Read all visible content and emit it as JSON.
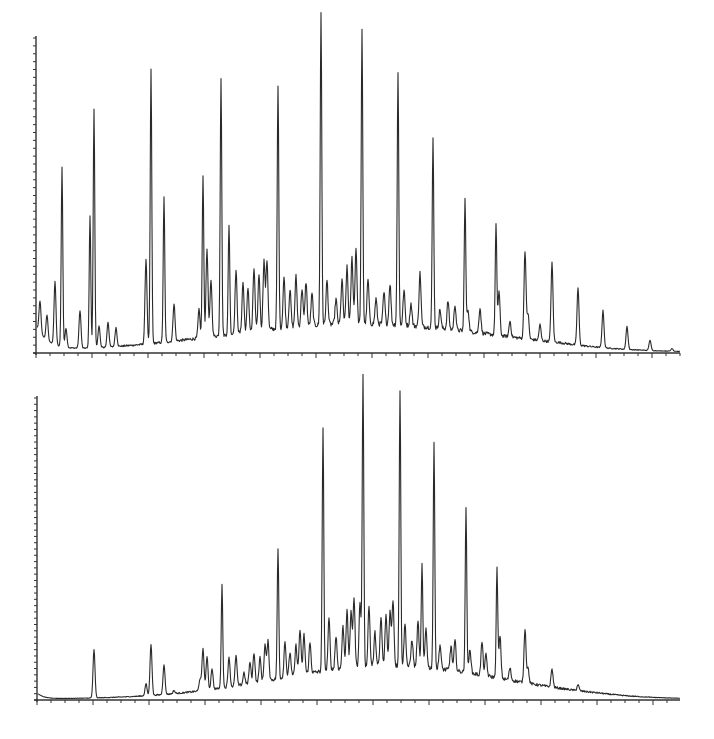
{
  "figure": {
    "caption_fragment": ""
  },
  "chart_data": [
    {
      "type": "line",
      "title": "",
      "subtitle": "Gas chromatogram (upper trace)",
      "xlabel": "",
      "ylabel": "",
      "grid": false,
      "legend": null,
      "x_range_px": [
        36,
        680
      ],
      "baseline_y_px": 353,
      "top_y_px": 38,
      "ylim": [
        0,
        100
      ],
      "y_minor_ticks": 40,
      "x_major_tick_step_px": 56,
      "x_minor_ticks_per_major": 4,
      "hump": {
        "center_x": 360,
        "height": 9,
        "width": 190
      },
      "start_decay": {
        "height": 8,
        "tau": 12
      },
      "tail_drop_from_x": 560,
      "peaks": [
        {
          "x": 40,
          "height": 10
        },
        {
          "x": 47,
          "height": 8
        },
        {
          "x": 55,
          "height": 20
        },
        {
          "x": 62,
          "height": 57
        },
        {
          "x": 66,
          "height": 6
        },
        {
          "x": 80,
          "height": 12
        },
        {
          "x": 90,
          "height": 42
        },
        {
          "x": 94,
          "height": 76
        },
        {
          "x": 99,
          "height": 7
        },
        {
          "x": 108,
          "height": 8
        },
        {
          "x": 116,
          "height": 6
        },
        {
          "x": 146,
          "height": 27
        },
        {
          "x": 151,
          "height": 87
        },
        {
          "x": 164,
          "height": 46
        },
        {
          "x": 174,
          "height": 12
        },
        {
          "x": 199,
          "height": 9
        },
        {
          "x": 203,
          "height": 51
        },
        {
          "x": 207,
          "height": 28
        },
        {
          "x": 211,
          "height": 18
        },
        {
          "x": 221,
          "height": 82
        },
        {
          "x": 229,
          "height": 35
        },
        {
          "x": 236,
          "height": 20
        },
        {
          "x": 243,
          "height": 16
        },
        {
          "x": 248,
          "height": 14
        },
        {
          "x": 254,
          "height": 20
        },
        {
          "x": 259,
          "height": 18
        },
        {
          "x": 264,
          "height": 22
        },
        {
          "x": 267,
          "height": 22
        },
        {
          "x": 278,
          "height": 77
        },
        {
          "x": 284,
          "height": 16
        },
        {
          "x": 290,
          "height": 12
        },
        {
          "x": 296,
          "height": 16
        },
        {
          "x": 302,
          "height": 12
        },
        {
          "x": 306,
          "height": 14
        },
        {
          "x": 312,
          "height": 10
        },
        {
          "x": 321,
          "height": 99
        },
        {
          "x": 327,
          "height": 14
        },
        {
          "x": 336,
          "height": 8
        },
        {
          "x": 342,
          "height": 14
        },
        {
          "x": 347,
          "height": 18
        },
        {
          "x": 352,
          "height": 21
        },
        {
          "x": 356,
          "height": 24
        },
        {
          "x": 362,
          "height": 93
        },
        {
          "x": 368,
          "height": 14
        },
        {
          "x": 376,
          "height": 8
        },
        {
          "x": 384,
          "height": 10
        },
        {
          "x": 390,
          "height": 13
        },
        {
          "x": 398,
          "height": 80
        },
        {
          "x": 404,
          "height": 11
        },
        {
          "x": 411,
          "height": 7
        },
        {
          "x": 420,
          "height": 17
        },
        {
          "x": 433,
          "height": 60
        },
        {
          "x": 440,
          "height": 6
        },
        {
          "x": 448,
          "height": 9
        },
        {
          "x": 455,
          "height": 8
        },
        {
          "x": 465,
          "height": 42
        },
        {
          "x": 468,
          "height": 7
        },
        {
          "x": 480,
          "height": 8
        },
        {
          "x": 496,
          "height": 35
        },
        {
          "x": 499,
          "height": 14
        },
        {
          "x": 510,
          "height": 5
        },
        {
          "x": 525,
          "height": 28
        },
        {
          "x": 528,
          "height": 8
        },
        {
          "x": 540,
          "height": 5
        },
        {
          "x": 552,
          "height": 25
        },
        {
          "x": 578,
          "height": 20
        },
        {
          "x": 603,
          "height": 15
        },
        {
          "x": 627,
          "height": 11
        },
        {
          "x": 650,
          "height": 6
        },
        {
          "x": 672,
          "height": 2
        }
      ]
    },
    {
      "type": "line",
      "title": "",
      "subtitle": "Gas chromatogram (lower trace)",
      "xlabel": "",
      "ylabel": "",
      "grid": false,
      "legend": null,
      "x_range_px": [
        37,
        680
      ],
      "baseline_y_px": 700,
      "top_y_px": 398,
      "ylim": [
        0,
        100
      ],
      "y_minor_ticks": 48,
      "x_major_tick_step_px": 56,
      "x_minor_ticks_per_major": 4,
      "hump": {
        "center_x": 390,
        "height": 11,
        "width": 160
      },
      "start_decay": {
        "height": 2,
        "tau": 6
      },
      "tail_drop_from_x": 600,
      "peaks": [
        {
          "x": 94,
          "height": 16
        },
        {
          "x": 146,
          "height": 4
        },
        {
          "x": 151,
          "height": 17
        },
        {
          "x": 164,
          "height": 10
        },
        {
          "x": 174,
          "height": 1
        },
        {
          "x": 200,
          "height": 4
        },
        {
          "x": 203,
          "height": 14
        },
        {
          "x": 207,
          "height": 11
        },
        {
          "x": 212,
          "height": 7
        },
        {
          "x": 222,
          "height": 34
        },
        {
          "x": 229,
          "height": 10
        },
        {
          "x": 236,
          "height": 10
        },
        {
          "x": 244,
          "height": 4
        },
        {
          "x": 250,
          "height": 7
        },
        {
          "x": 254,
          "height": 10
        },
        {
          "x": 260,
          "height": 8
        },
        {
          "x": 265,
          "height": 12
        },
        {
          "x": 268,
          "height": 13
        },
        {
          "x": 278,
          "height": 43
        },
        {
          "x": 285,
          "height": 12
        },
        {
          "x": 290,
          "height": 8
        },
        {
          "x": 296,
          "height": 10
        },
        {
          "x": 300,
          "height": 15
        },
        {
          "x": 304,
          "height": 13
        },
        {
          "x": 310,
          "height": 10
        },
        {
          "x": 323,
          "height": 80
        },
        {
          "x": 329,
          "height": 17
        },
        {
          "x": 336,
          "height": 11
        },
        {
          "x": 343,
          "height": 14
        },
        {
          "x": 347,
          "height": 19
        },
        {
          "x": 351,
          "height": 18
        },
        {
          "x": 354,
          "height": 23
        },
        {
          "x": 360,
          "height": 21
        },
        {
          "x": 363,
          "height": 96
        },
        {
          "x": 369,
          "height": 20
        },
        {
          "x": 375,
          "height": 11
        },
        {
          "x": 381,
          "height": 16
        },
        {
          "x": 386,
          "height": 17
        },
        {
          "x": 390,
          "height": 18
        },
        {
          "x": 393,
          "height": 22
        },
        {
          "x": 400,
          "height": 91
        },
        {
          "x": 405,
          "height": 14
        },
        {
          "x": 412,
          "height": 9
        },
        {
          "x": 418,
          "height": 15
        },
        {
          "x": 422,
          "height": 34
        },
        {
          "x": 426,
          "height": 13
        },
        {
          "x": 434,
          "height": 74
        },
        {
          "x": 440,
          "height": 8
        },
        {
          "x": 451,
          "height": 8
        },
        {
          "x": 455,
          "height": 10
        },
        {
          "x": 466,
          "height": 54
        },
        {
          "x": 470,
          "height": 8
        },
        {
          "x": 482,
          "height": 11
        },
        {
          "x": 486,
          "height": 7
        },
        {
          "x": 497,
          "height": 36
        },
        {
          "x": 500,
          "height": 14
        },
        {
          "x": 510,
          "height": 4
        },
        {
          "x": 525,
          "height": 18
        },
        {
          "x": 528,
          "height": 5
        },
        {
          "x": 552,
          "height": 6
        },
        {
          "x": 578,
          "height": 2
        }
      ]
    }
  ]
}
